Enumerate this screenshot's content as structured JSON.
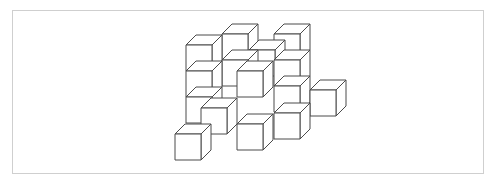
{
  "figure": {
    "cube_size": 26,
    "depth_dx": 10,
    "depth_dy": -10,
    "stroke_color": "#4a4a4a",
    "fill_color": "#ffffff",
    "frame_border_color": "#cfcfcf",
    "cubes": [
      {
        "x": 222,
        "y": 34
      },
      {
        "x": 274,
        "y": 34
      },
      {
        "x": 186,
        "y": 45
      },
      {
        "x": 249,
        "y": 50
      },
      {
        "x": 222,
        "y": 60
      },
      {
        "x": 274,
        "y": 60
      },
      {
        "x": 186,
        "y": 71
      },
      {
        "x": 237,
        "y": 71
      },
      {
        "x": 310,
        "y": 90
      },
      {
        "x": 274,
        "y": 86
      },
      {
        "x": 186,
        "y": 97
      },
      {
        "x": 201,
        "y": 108
      },
      {
        "x": 274,
        "y": 113
      },
      {
        "x": 237,
        "y": 124
      },
      {
        "x": 175,
        "y": 134
      }
    ]
  }
}
